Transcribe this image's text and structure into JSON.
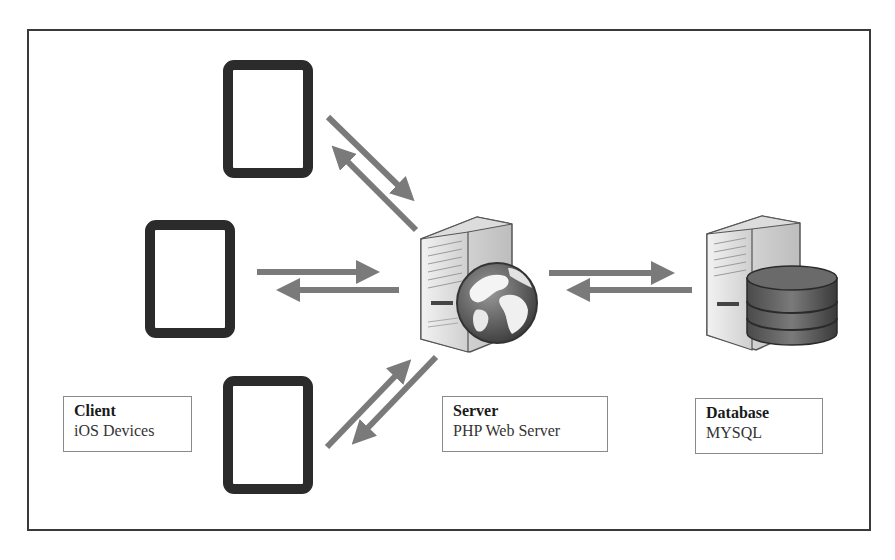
{
  "diagram": {
    "type": "client-server architecture",
    "nodes": {
      "client": {
        "title": "Client",
        "subtitle": "iOS Devices",
        "device_count": 3,
        "icon": "tablet-icon"
      },
      "server": {
        "title": "Server",
        "subtitle": "PHP Web Server",
        "icon": "web-server-globe-icon"
      },
      "database": {
        "title": "Database",
        "subtitle": "MYSQL",
        "icon": "database-server-icon"
      }
    },
    "edges": [
      {
        "from": "client-top",
        "to": "server",
        "bidirectional": true
      },
      {
        "from": "client-middle",
        "to": "server",
        "bidirectional": true
      },
      {
        "from": "client-bottom",
        "to": "server",
        "bidirectional": true
      },
      {
        "from": "server",
        "to": "database",
        "bidirectional": true
      }
    ],
    "colors": {
      "arrow": "#7a7a7a",
      "tablet_border": "#2b2b2b",
      "frame": "#3a3a3a",
      "label_border": "#8a8a8a"
    }
  }
}
